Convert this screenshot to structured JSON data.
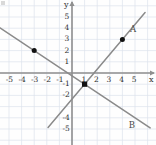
{
  "figure": {
    "axis_labels": {
      "x": "x",
      "y": "y"
    },
    "line_labels": {
      "a": "A",
      "b": "B"
    }
  },
  "chart_data": {
    "type": "line",
    "title": "",
    "xlabel": "x",
    "ylabel": "y",
    "xlim": [
      -6.2,
      6.4
    ],
    "ylim": [
      -6.0,
      6.2
    ],
    "grid": true,
    "grid_spacing": 1,
    "legend": "inline-labels",
    "xticks": [
      -5,
      -4,
      -3,
      -2,
      -1,
      1,
      2,
      3,
      4,
      5
    ],
    "xtick_labels": [
      "-5",
      "-4",
      "-3",
      "-2",
      "-1",
      "1",
      "2",
      "3",
      "4",
      "5"
    ],
    "yticks": [
      5,
      4,
      3,
      2,
      1,
      -1,
      -2,
      -4,
      -5
    ],
    "ytick_labels": [
      "5",
      "4",
      "3",
      "2",
      "1",
      "-1",
      "-2",
      "-4",
      "-5"
    ],
    "series": [
      {
        "name": "A",
        "label": "A",
        "color": "#8a8a8a",
        "slope": 1.3333,
        "intercept": -2.3333,
        "through": [
          [
            1,
            -1
          ],
          [
            4,
            3
          ]
        ],
        "points": [
          {
            "x": 4,
            "y": 3,
            "marker": "filled-circle"
          }
        ],
        "x_extent": [
          -1.9,
          5.8
        ],
        "label_position": {
          "x": 4.6,
          "y": 4.3
        }
      },
      {
        "name": "B",
        "label": "B",
        "color": "#8a8a8a",
        "slope": -0.75,
        "intercept": -0.25,
        "through": [
          [
            -3,
            2
          ],
          [
            1,
            -1
          ]
        ],
        "points": [
          {
            "x": -3,
            "y": 2,
            "marker": "filled-circle"
          }
        ],
        "x_extent": [
          -6.2,
          6.2
        ],
        "label_position": {
          "x": 4.5,
          "y": -4.3
        }
      }
    ],
    "intersection": {
      "x": 1,
      "y": -1,
      "marker": "filled-square"
    },
    "colors": {
      "grid": "#dde3ec",
      "axis": "#8f8f8f",
      "line": "#8a8a8a",
      "marker": "#111111",
      "text": "#2e2e2e",
      "background": "#fefefe"
    }
  }
}
